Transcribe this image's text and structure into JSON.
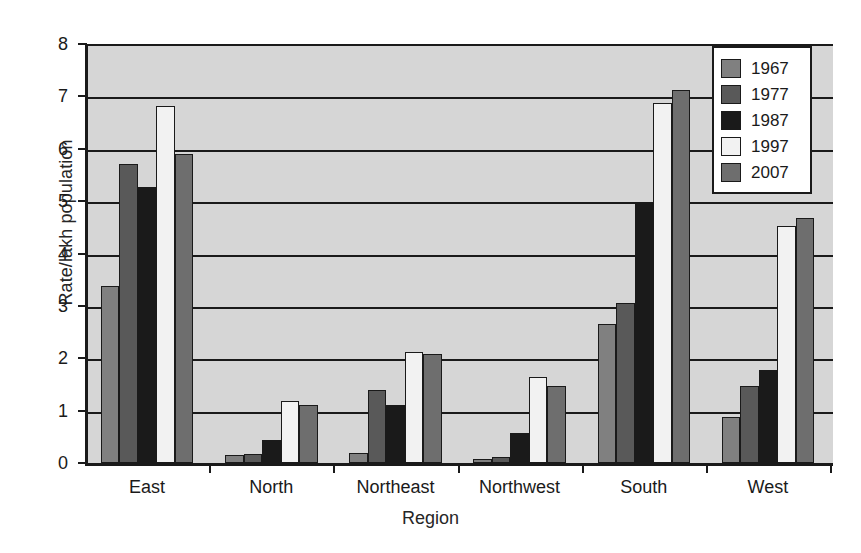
{
  "chart_data": {
    "type": "bar",
    "title": "",
    "xlabel": "Region",
    "ylabel": "Rate/lakh population",
    "categories": [
      "East",
      "North",
      "Northeast",
      "Northwest",
      "South",
      "West"
    ],
    "series": [
      {
        "name": "1967",
        "color": "#808080",
        "values": [
          3.38,
          0.15,
          0.2,
          0.07,
          2.65,
          0.87
        ]
      },
      {
        "name": "1977",
        "color": "#595959",
        "values": [
          5.7,
          0.18,
          1.4,
          0.12,
          3.05,
          1.47
        ]
      },
      {
        "name": "1987",
        "color": "#1a1a1a",
        "values": [
          5.27,
          0.43,
          1.1,
          0.57,
          4.95,
          1.77
        ]
      },
      {
        "name": "1997",
        "color": "#f2f2f2",
        "values": [
          6.82,
          1.18,
          2.12,
          1.65,
          6.88,
          4.52
        ]
      },
      {
        "name": "2007",
        "color": "#6e6e6e",
        "values": [
          5.9,
          1.1,
          2.08,
          1.48,
          7.13,
          4.68
        ]
      }
    ],
    "ylim": [
      0,
      8
    ],
    "yticks": [
      0,
      1,
      2,
      3,
      4,
      5,
      6,
      7,
      8
    ],
    "grid": true,
    "legend_position": "top-right",
    "plot_background": "#d6d6d6",
    "axis_color": "#1a1a1a"
  },
  "caption": ""
}
